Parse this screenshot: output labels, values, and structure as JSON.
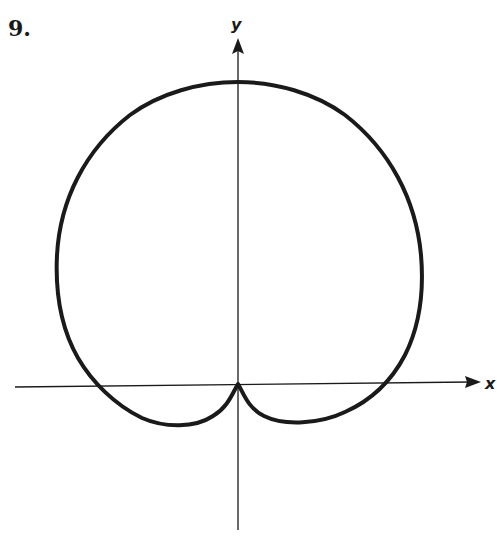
{
  "problem_number": "9.",
  "axes": {
    "x_label": "x",
    "y_label": "y",
    "origin_px": [
      238,
      384
    ]
  },
  "curve": {
    "description": "closed polar curve with cusp at origin and two small lower lobes below the x-axis",
    "stroke_color": "#1a1a1a"
  },
  "colors": {
    "background": "#ffffff",
    "ink": "#1a1a1a"
  }
}
